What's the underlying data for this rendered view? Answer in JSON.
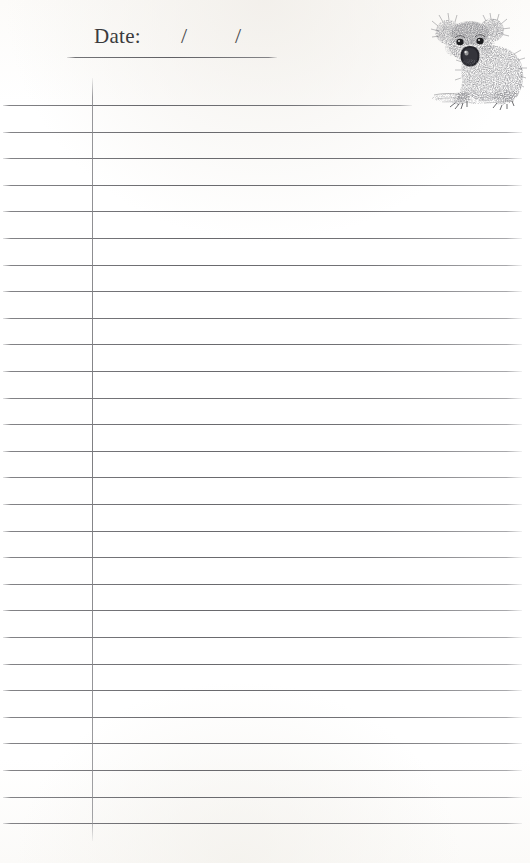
{
  "page": {
    "kind": "lined-notepad-sheet",
    "width": 530,
    "height": 863,
    "background_color": "#ffffff",
    "paper_tint": "#fcfbf9"
  },
  "header": {
    "date_label": "Date:",
    "slash_1": "/",
    "slash_2": "/",
    "underline": {
      "present": true,
      "color": "#6c6c70"
    }
  },
  "ruled_area": {
    "line_color": "#68686c",
    "line_count": 28,
    "first_line_y": 105,
    "line_spacing": 26.6,
    "first_line_is_short": true,
    "short_line_width": 409,
    "full_line_width": 519,
    "left_margin_x": 3
  },
  "margin_rule": {
    "present": true,
    "x": 92,
    "top": 78,
    "bottom": 841,
    "color": "#87878b"
  },
  "illustration": {
    "subject": "koala",
    "style": "pen-and-ink stipple drawing",
    "ink_color": "#4a4a4c",
    "position": "top-right",
    "alt_text": "Koala sitting, facing forward, drawn in stippled ink"
  }
}
